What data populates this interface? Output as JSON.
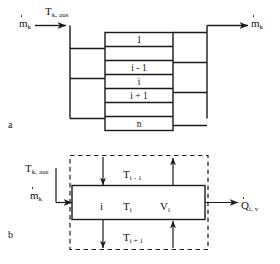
{
  "figure": {
    "width": 280,
    "height": 264,
    "background": "#ffffff",
    "line_color": "#1a1a1a"
  },
  "panel_a": {
    "tag": "a",
    "inlet": {
      "temperature_label": {
        "base": "T",
        "sub": "k, aus"
      },
      "massflow_label": {
        "base": "m",
        "sub": "k",
        "dotted": true
      }
    },
    "outlet": {
      "massflow_label": {
        "base": "m",
        "sub": "k",
        "dotted": true
      }
    },
    "stack": {
      "rows": [
        {
          "label": "1"
        },
        {
          "label": ""
        },
        {
          "label": "i - 1"
        },
        {
          "label": "i"
        },
        {
          "label": "i + 1"
        },
        {
          "label": ""
        },
        {
          "label": "n"
        }
      ]
    }
  },
  "panel_b": {
    "tag": "b",
    "inlet": {
      "temperature_label": {
        "base": "T",
        "sub": "k, aus"
      },
      "massflow_label": {
        "base": "m",
        "sub": "k",
        "dotted": true
      }
    },
    "cell": {
      "index_label": "i",
      "temperature_label": {
        "base": "T",
        "sub": "i"
      },
      "volume_label": {
        "base": "V",
        "sub": "i"
      }
    },
    "neighbour_above": {
      "base": "T",
      "sub": "i - 1"
    },
    "neighbour_below": {
      "base": "T",
      "sub": "i + 1"
    },
    "heat_flow": {
      "base": "Q",
      "sub": "i, v",
      "dotted": true
    }
  }
}
